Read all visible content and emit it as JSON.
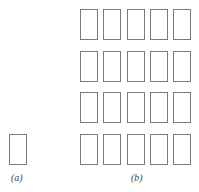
{
  "figure": {
    "panel_a": {
      "label": "(a)",
      "rows": 1,
      "cols": 1
    },
    "panel_b": {
      "label": "(b)",
      "rows": 4,
      "cols": 5
    },
    "stroke_color": "#7a7a7a"
  }
}
